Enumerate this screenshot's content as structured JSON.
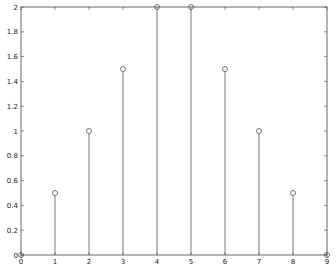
{
  "chart_data": {
    "type": "stem",
    "title": "",
    "xlabel": "",
    "ylabel": "",
    "x": [
      0,
      1,
      2,
      3,
      4,
      5,
      6,
      7,
      8,
      9
    ],
    "values": [
      0,
      0.5,
      1,
      1.5,
      2,
      2,
      1.5,
      1,
      0.5,
      0
    ],
    "xlim": [
      0,
      9
    ],
    "ylim": [
      0,
      2
    ],
    "xticks": [
      "0",
      "1",
      "2",
      "3",
      "4",
      "5",
      "6",
      "7",
      "8",
      "9"
    ],
    "yticks": [
      "0",
      "0.2",
      "0.4",
      "0.6",
      "0.8",
      "1",
      "1.2",
      "1.4",
      "1.6",
      "1.8",
      "2"
    ],
    "grid": false,
    "legend": null,
    "marker": "circle-open",
    "color": "#555555"
  }
}
